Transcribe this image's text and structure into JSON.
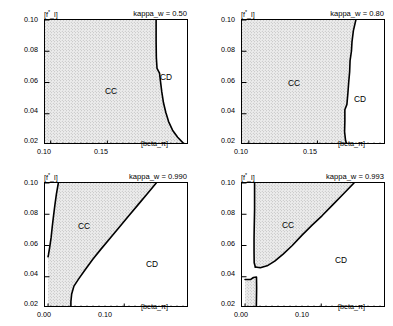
{
  "figure": {
    "background": "#ffffff",
    "region_fill": "#e8e8e8",
    "curve_color": "#000000",
    "axis_color": "#000000"
  },
  "common": {
    "ylabel": "[f*_l]",
    "xlabel": "[beta_π]",
    "region_cc": "CC",
    "region_cd": "CD",
    "yticks": [
      "0.10",
      "0.08",
      "0.06",
      "0.04",
      "0.02"
    ],
    "ytick_values": [
      0.1,
      0.08,
      0.06,
      0.04,
      0.02
    ],
    "ylim": [
      0.02,
      0.1
    ]
  },
  "panels": [
    {
      "id": "panel-top-left",
      "param_label": "kappa_w = 0.50",
      "kappa_w": 0.5,
      "xticks": [
        "0.10",
        "0.15"
      ],
      "xtick_values": [
        0.1,
        0.15
      ],
      "xlim": [
        0.095,
        0.222
      ],
      "cc_label_pos": {
        "x": 0.142,
        "y": 0.058
      },
      "cd_label_pos": {
        "x": 0.207,
        "y": 0.07
      }
    },
    {
      "id": "panel-top-right",
      "param_label": "kappa_w = 0.80",
      "kappa_w": 0.8,
      "xticks": [
        "0.10",
        "0.15"
      ],
      "xtick_values": [
        0.1,
        0.15
      ],
      "xlim": [
        0.095,
        0.2
      ],
      "cc_label_pos": {
        "x": 0.133,
        "y": 0.062
      },
      "cd_label_pos": {
        "x": 0.185,
        "y": 0.052
      }
    },
    {
      "id": "panel-bottom-left",
      "param_label": "kappa_w = 0.990",
      "kappa_w": 0.99,
      "xticks": [
        "0.00",
        "0.10"
      ],
      "xtick_values": [
        0.0,
        0.1
      ],
      "xlim": [
        -0.004,
        0.185
      ],
      "cc_label_pos": {
        "x": 0.047,
        "y": 0.082
      },
      "cd_label_pos": {
        "x": 0.135,
        "y": 0.055
      }
    },
    {
      "id": "panel-bottom-right",
      "param_label": "kappa_w = 0.993",
      "kappa_w": 0.993,
      "xticks": [
        "0.00",
        "0.10"
      ],
      "xtick_values": [
        0.0,
        0.1
      ],
      "xlim": [
        -0.004,
        0.185
      ],
      "cc_label_pos": {
        "x": 0.055,
        "y": 0.083
      },
      "cd_label_pos": {
        "x": 0.125,
        "y": 0.058
      }
    }
  ],
  "chart_data": {
    "type": "line",
    "title": "",
    "subplots": 4,
    "layout": "2x2 grid of phase diagrams",
    "xlabel": "[beta_π]",
    "ylabel": "[f*_l]",
    "grid": false,
    "legend": "none",
    "annotations": [
      "CC",
      "CD"
    ],
    "panels": [
      {
        "name": "kappa_w = 0.50",
        "xlim": [
          0.095,
          0.222
        ],
        "ylim": [
          0.02,
          0.1
        ],
        "boundary_curve": {
          "name": "CC/CD boundary",
          "points": [
            [
              0.193,
              0.1
            ],
            [
              0.193,
              0.086
            ],
            [
              0.1932,
              0.076
            ],
            [
              0.1938,
              0.069
            ],
            [
              0.196,
              0.066
            ],
            [
              0.1968,
              0.061
            ],
            [
              0.198,
              0.054
            ],
            [
              0.1995,
              0.047
            ],
            [
              0.2015,
              0.041
            ],
            [
              0.204,
              0.035
            ],
            [
              0.2075,
              0.0295
            ],
            [
              0.212,
              0.025
            ],
            [
              0.2165,
              0.0215
            ],
            [
              0.2195,
              0.02
            ]
          ]
        }
      },
      {
        "name": "kappa_w = 0.80",
        "xlim": [
          0.095,
          0.2
        ],
        "ylim": [
          0.02,
          0.1
        ],
        "boundary_curve": {
          "name": "CC/CD boundary",
          "points": [
            [
              0.178,
              0.1
            ],
            [
              0.1762,
              0.093
            ],
            [
              0.1752,
              0.086
            ],
            [
              0.1748,
              0.08
            ],
            [
              0.1738,
              0.074
            ],
            [
              0.1735,
              0.067
            ],
            [
              0.1728,
              0.06
            ],
            [
              0.1722,
              0.053
            ],
            [
              0.1715,
              0.046
            ],
            [
              0.17,
              0.0425
            ],
            [
              0.17,
              0.035
            ],
            [
              0.1698,
              0.0285
            ],
            [
              0.1705,
              0.023
            ],
            [
              0.1715,
              0.02
            ]
          ]
        }
      },
      {
        "name": "kappa_w = 0.990",
        "xlim": [
          -0.004,
          0.185
        ],
        "ylim": [
          0.02,
          0.1
        ],
        "left_boundary_curve": {
          "name": "CC left boundary",
          "points": [
            [
              0.0135,
              0.1
            ],
            [
              0.011,
              0.093
            ],
            [
              0.009,
              0.086
            ],
            [
              0.0072,
              0.079
            ],
            [
              0.0055,
              0.072
            ],
            [
              0.004,
              0.065
            ],
            [
              0.0022,
              0.059
            ],
            [
              0.0005,
              0.054
            ],
            [
              0.0,
              0.0528
            ]
          ]
        },
        "right_boundary_curve": {
          "name": "CC right boundary",
          "points": [
            [
              0.142,
              0.1
            ],
            [
              0.13,
              0.093
            ],
            [
              0.118,
              0.086
            ],
            [
              0.106,
              0.079
            ],
            [
              0.094,
              0.072
            ],
            [
              0.082,
              0.065
            ],
            [
              0.07,
              0.058
            ],
            [
              0.0585,
              0.051
            ],
            [
              0.048,
              0.044
            ],
            [
              0.04,
              0.0385
            ],
            [
              0.034,
              0.034
            ],
            [
              0.031,
              0.029
            ],
            [
              0.03,
              0.024
            ],
            [
              0.03,
              0.02
            ]
          ]
        }
      },
      {
        "name": "kappa_w = 0.993",
        "xlim": [
          -0.004,
          0.185
        ],
        "ylim": [
          0.02,
          0.1
        ],
        "upper_cc_left_boundary": {
          "name": "upper CC left edge",
          "points": [
            [
              0.0125,
              0.1
            ],
            [
              0.0125,
              0.083
            ],
            [
              0.012,
              0.07
            ],
            [
              0.0118,
              0.064
            ],
            [
              0.0118,
              0.056
            ],
            [
              0.012,
              0.049
            ],
            [
              0.0135,
              0.0462
            ]
          ]
        },
        "upper_cc_right_boundary": {
          "name": "upper CC right edge",
          "points": [
            [
              0.143,
              0.1
            ],
            [
              0.129,
              0.093
            ],
            [
              0.115,
              0.086
            ],
            [
              0.101,
              0.079
            ],
            [
              0.088,
              0.073
            ],
            [
              0.0745,
              0.0665
            ],
            [
              0.062,
              0.06
            ],
            [
              0.05,
              0.0545
            ],
            [
              0.039,
              0.05
            ],
            [
              0.029,
              0.047
            ],
            [
              0.02,
              0.0458
            ],
            [
              0.0135,
              0.0462
            ]
          ]
        },
        "lower_cc_region": {
          "name": "lower CC island",
          "points": [
            [
              0.0,
              0.0382
            ],
            [
              0.007,
              0.0382
            ],
            [
              0.011,
              0.0395
            ],
            [
              0.015,
              0.0398
            ],
            [
              0.0152,
              0.033
            ],
            [
              0.015,
              0.026
            ],
            [
              0.0148,
              0.02
            ],
            [
              0.0,
              0.02
            ]
          ]
        }
      }
    ]
  }
}
